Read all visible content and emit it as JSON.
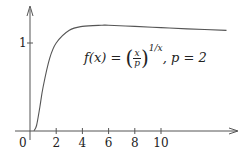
{
  "chart_data": {
    "type": "line",
    "title": "",
    "annotation": "f(x) = (x/p)^(1/x),  p = 2",
    "annotation_parts": {
      "lhs": "f(x) = ",
      "frac_num": "x",
      "frac_den": "p",
      "exponent": "1/x",
      "param": ",  p = 2"
    },
    "xlabel": "",
    "ylabel": "",
    "xlim": [
      0,
      15.7
    ],
    "ylim": [
      0,
      1.41
    ],
    "x_ticks": [
      2,
      4,
      6,
      8,
      10
    ],
    "x_tick_labels": [
      "2",
      "4",
      "6",
      "8",
      "10"
    ],
    "origin_label": "0",
    "y_ticks": [
      1
    ],
    "y_tick_labels": [
      "1"
    ],
    "grid": false,
    "legend": null,
    "series": [
      {
        "name": "f(x) = (x/2)^(1/x)",
        "x": [
          0.3,
          0.5,
          0.75,
          1,
          1.5,
          2,
          3,
          4,
          5.44,
          6,
          8,
          10,
          12,
          15
        ],
        "y": [
          0.002,
          0.0625,
          0.27,
          0.5,
          0.825,
          1.0,
          1.145,
          1.189,
          1.202,
          1.201,
          1.189,
          1.175,
          1.161,
          1.144
        ]
      }
    ],
    "colors": {
      "axis": "#555555",
      "curve": "#555555",
      "text": "#222222"
    }
  }
}
